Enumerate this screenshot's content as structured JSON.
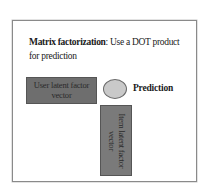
{
  "diagram": {
    "title_bold": "Matrix factorization",
    "title_rest": ": Use a DOT product for prediction",
    "user_vector_label": "User latent factor vector",
    "item_vector_label": "Item latent factor vector",
    "prediction_label": "Prediction",
    "colors": {
      "frame_border": "#8a8a8a",
      "user_box": "#6e6e6e",
      "item_box": "#7a7a7a",
      "prediction_circle": "#c9c9c9"
    }
  }
}
